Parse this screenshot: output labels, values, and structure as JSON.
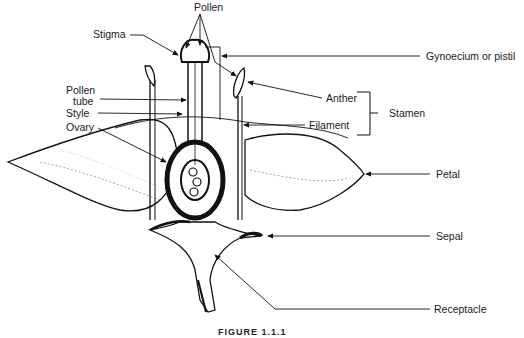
{
  "diagram": {
    "labels": {
      "pollen": "Pollen",
      "stigma": "Stigma",
      "pollen_tube_1": "Pollen",
      "pollen_tube_2": "tube",
      "style": "Style",
      "ovary": "Ovary",
      "gynoecium": "Gynoecium or pistil",
      "anther": "Anther",
      "filament": "Filament",
      "stamen": "Stamen",
      "petal": "Petal",
      "sepal": "Sepal",
      "receptacle": "Receptacle"
    },
    "caption": "FIGURE 1.1.1",
    "colors": {
      "ink": "#111111",
      "background": "#ffffff"
    }
  }
}
